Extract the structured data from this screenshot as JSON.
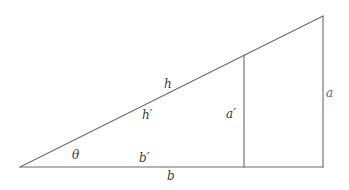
{
  "diagram": {
    "type": "similar-right-triangles",
    "colors": {
      "line": "#6a6a6a",
      "text": "#3a3a3a",
      "accent_label": "#4a6a9a",
      "background": "#ffffff"
    },
    "outer_triangle": {
      "vertices": {
        "apex": [
          20,
          167
        ],
        "right_angle": [
          323,
          167
        ],
        "top": [
          323,
          16
        ]
      },
      "labels": {
        "hypotenuse": "h",
        "opposite": "a",
        "adjacent": "b"
      }
    },
    "inner_triangle": {
      "vertices": {
        "apex": [
          20,
          167
        ],
        "right_angle": [
          244,
          167
        ],
        "top": [
          244,
          55
        ]
      },
      "labels": {
        "hypotenuse": "h′",
        "opposite": "a′",
        "adjacent": "b′"
      }
    },
    "angle": {
      "label": "θ"
    }
  }
}
